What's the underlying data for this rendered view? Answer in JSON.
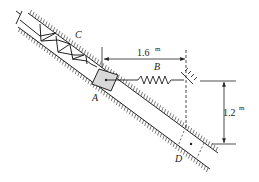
{
  "diagram": {
    "type": "mechanics-figure",
    "labels": {
      "A": "A",
      "B": "B",
      "C": "C",
      "D": "D"
    },
    "dimensions": {
      "horizontal": {
        "value": "1.6",
        "unit": "m"
      },
      "vertical": {
        "value": "1.2",
        "unit": "m"
      }
    },
    "colors": {
      "line": "#222222",
      "block_fill": "#d9d9d9",
      "background": "#ffffff"
    }
  }
}
